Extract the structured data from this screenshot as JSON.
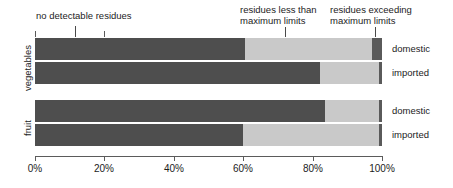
{
  "chart_data": {
    "type": "bar",
    "orientation": "horizontal",
    "stacked": true,
    "normalized_percent": true,
    "title": "",
    "xlabel": "",
    "ylabel": "",
    "xlim": [
      0,
      100
    ],
    "grid": false,
    "legend_position": "top-inline-annotations",
    "categories": [
      "vegetables / domestic",
      "vegetables / imported",
      "fruit / domestic",
      "fruit / imported"
    ],
    "series": [
      {
        "name": "no detectable residues",
        "color": "#4e4e4e",
        "values": [
          60.5,
          82.0,
          83.5,
          60.0
        ]
      },
      {
        "name": "residues less than maximum limits",
        "color": "#c9c9c9",
        "values": [
          36.5,
          17.0,
          15.5,
          39.0
        ]
      },
      {
        "name": "residues exceeding maximum limits",
        "color": "#5a5a5a",
        "values": [
          3.0,
          1.0,
          1.0,
          1.0
        ]
      }
    ],
    "xticks": [
      0,
      20,
      40,
      60,
      80,
      100
    ],
    "xtick_labels": [
      "0%",
      "20%",
      "40%",
      "60%",
      "80%",
      "100%"
    ],
    "groups": [
      {
        "label": "vegetables",
        "rows": [
          {
            "label": "domestic",
            "values": [
              60.5,
              36.5,
              3.0
            ]
          },
          {
            "label": "imported",
            "values": [
              82.0,
              17.0,
              1.0
            ]
          }
        ]
      },
      {
        "label": "fruit",
        "rows": [
          {
            "label": "domestic",
            "values": [
              83.5,
              15.5,
              1.0
            ]
          },
          {
            "label": "imported",
            "values": [
              60.0,
              39.0,
              1.0
            ]
          }
        ]
      }
    ],
    "annotations": [
      {
        "text": "no detectable residues",
        "anchor_percent": 11.5
      },
      {
        "text": "residues less than\nmaximum limits",
        "anchor_percent": 72.0
      },
      {
        "text": "residues exceeding\nmaximum limits",
        "anchor_percent": 98.0
      }
    ]
  },
  "axis": {
    "ticks": [
      {
        "label": "0%",
        "percent": 0
      },
      {
        "label": "20%",
        "percent": 20
      },
      {
        "label": "40%",
        "percent": 40
      },
      {
        "label": "60%",
        "percent": 60
      },
      {
        "label": "80%",
        "percent": 80
      },
      {
        "label": "100%",
        "percent": 100
      }
    ]
  },
  "colors": {
    "no_detectable": "#4e4e4e",
    "less_than_limit": "#c9c9c9",
    "exceeding_limit": "#5a5a5a",
    "axis": "#5b5b5b",
    "text": "#1c1c1c",
    "background": "#ffffff"
  }
}
